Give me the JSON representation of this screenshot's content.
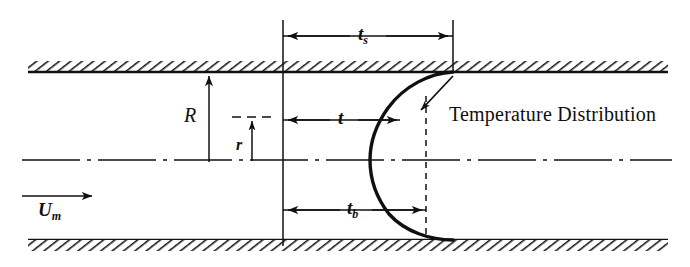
{
  "figure": {
    "domain": "diagram",
    "background_color": "#ffffff",
    "ink_color": "#101010",
    "width": 690,
    "height": 267
  },
  "labels": {
    "radius_outer": "R",
    "radius_inner": "r",
    "mean_velocity": "U",
    "mean_velocity_sub": "m",
    "thickness_surface": "t",
    "thickness_surface_sub": "s",
    "thickness_mid": "t",
    "thickness_bulk": "t",
    "thickness_bulk_sub": "b",
    "curve_annotation": "Temperature Distribution"
  },
  "geometry": {
    "top_wall_y": 72,
    "bottom_wall_y": 240,
    "centerline_y": 160,
    "wall_left_x": 28,
    "wall_right_x": 668,
    "reference_line_x": 283,
    "surface_line_x": 453,
    "dashed_apex_x": 426,
    "curve_apex_x": 372,
    "hatch_band_height": 11
  },
  "dimension_arrows": [
    {
      "name": "t_s",
      "y": 36,
      "x_from": 283,
      "x_to": 453,
      "label": "ts"
    },
    {
      "name": "t",
      "y": 120,
      "x_from": 283,
      "x_to": 400,
      "label": "t"
    },
    {
      "name": "t_b",
      "y": 210,
      "x_from": 283,
      "x_to": 412,
      "label": "tb"
    }
  ],
  "vertical_arrows": [
    {
      "name": "R",
      "x": 209,
      "y_from": 160,
      "y_to": 74,
      "label": "R"
    },
    {
      "name": "r",
      "x": 252,
      "y_from": 160,
      "y_to": 117,
      "label": "r"
    }
  ],
  "flow_arrow": {
    "name": "U_m",
    "x_from": 22,
    "x_to": 92,
    "y": 196,
    "label": "Um"
  },
  "curve": {
    "type": "temperature-profile",
    "description": "bullet-shaped thermal boundary profile opening to the left",
    "stroke_width": 3.2,
    "apex_x": 372,
    "top_contact_x": 453,
    "bottom_contact_x": 453
  },
  "leader": {
    "name": "temperature-distribution-leader",
    "x_from": 453,
    "y_from": 78,
    "x_to": 423,
    "y_to": 108
  }
}
